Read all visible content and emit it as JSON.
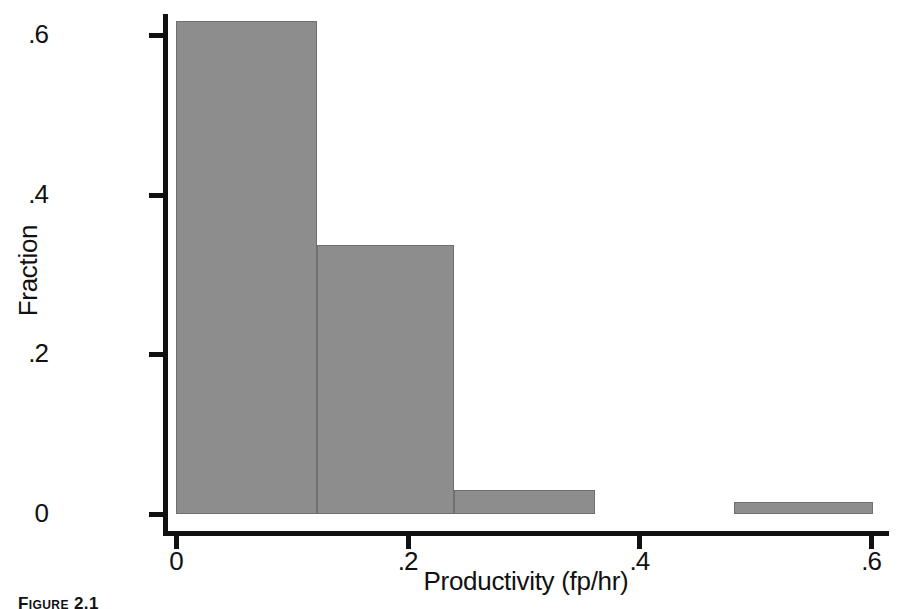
{
  "figure": {
    "caption": "Figure 2.1"
  },
  "chart_data": {
    "type": "bar",
    "title": "",
    "subtitle": "",
    "xlabel": "Productivity (fp/hr)",
    "ylabel": "Fraction",
    "xlim": [
      0,
      0.62
    ],
    "ylim": [
      0,
      0.653
    ],
    "grid": false,
    "legend": null,
    "histogram": true,
    "xticks": [
      {
        "value": 0,
        "label": "0"
      },
      {
        "value": 0.2,
        "label": ".2"
      },
      {
        "value": 0.4,
        "label": ".4"
      },
      {
        "value": 0.6,
        "label": ".6"
      }
    ],
    "yticks": [
      {
        "value": 0,
        "label": "0"
      },
      {
        "value": 0.2,
        "label": ".2"
      },
      {
        "value": 0.4,
        "label": ".4"
      },
      {
        "value": 0.6,
        "label": ".6"
      }
    ],
    "bars": [
      {
        "label": "0–.12",
        "x0": 0.0,
        "x1": 0.122,
        "value": 0.617
      },
      {
        "label": ".12–.24",
        "x0": 0.122,
        "x1": 0.24,
        "value": 0.337
      },
      {
        "label": ".24–.36",
        "x0": 0.24,
        "x1": 0.362,
        "value": 0.03
      },
      {
        "label": ".48–.60",
        "x0": 0.482,
        "x1": 0.602,
        "value": 0.015
      }
    ],
    "bar_color": "#8d8d8d",
    "bar_edge_color": "#6f6f6f",
    "axis_color": "#111111"
  }
}
